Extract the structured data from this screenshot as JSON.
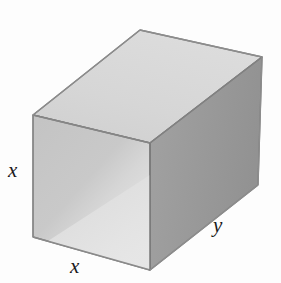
{
  "figure": {
    "name": "rectangular-box",
    "background_color": "#fdfdfd"
  },
  "labels": {
    "height": "x",
    "depth": "x",
    "length": "y"
  },
  "colors": {
    "top_face": "#d4d4d4",
    "top_face_light": "#dedede",
    "front_face": "#c6c6c6",
    "front_face_light": "#e2e2e2",
    "right_face": "#9a9a9a",
    "right_face_dark": "#8e8e8e",
    "edge": "#7d7d7d",
    "label_color": "#1a1a1a"
  },
  "geometry": {
    "front_top_left": [
      33,
      115
    ],
    "front_bottom_left": [
      33,
      237
    ],
    "front_top_right": [
      150,
      143
    ],
    "front_bottom_right": [
      150,
      270
    ],
    "back_top_left": [
      140,
      30
    ],
    "back_top_right": [
      262,
      57
    ],
    "back_bottom_right": [
      258,
      185
    ]
  }
}
